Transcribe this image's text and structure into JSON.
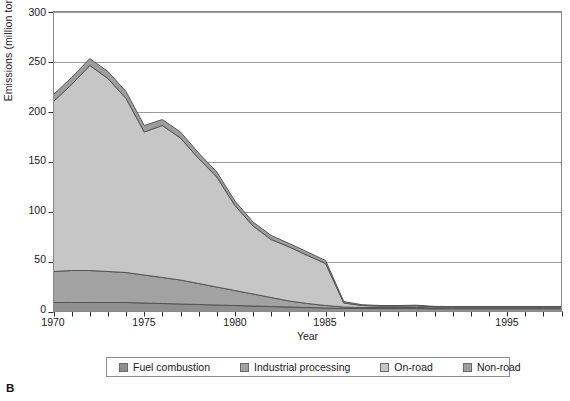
{
  "panel": {
    "label": "B"
  },
  "chart_data": {
    "type": "area",
    "stacked": true,
    "title": "",
    "xlabel": "Year",
    "ylabel": "Emissions (million tons)",
    "xlim": [
      1970,
      1998
    ],
    "ylim": [
      0,
      300
    ],
    "yticks": [
      0,
      50,
      100,
      150,
      200,
      250,
      300
    ],
    "xticks": [
      1970,
      1971,
      1972,
      1973,
      1974,
      1975,
      1976,
      1977,
      1978,
      1979,
      1980,
      1981,
      1982,
      1983,
      1984,
      1985,
      1986,
      1987,
      1988,
      1989,
      1990,
      1991,
      1992,
      1993,
      1994,
      1995,
      1996,
      1997,
      1998
    ],
    "xtick_labels": [
      1970,
      1975,
      1980,
      1985,
      1995
    ],
    "xtick_labels_shown": [
      "1970",
      "1975",
      "1980",
      "1985",
      "1995"
    ],
    "grid": "horizontal",
    "legend_position": "below",
    "x": [
      1970,
      1971,
      1972,
      1973,
      1974,
      1975,
      1976,
      1977,
      1978,
      1979,
      1980,
      1981,
      1982,
      1983,
      1984,
      1985,
      1986,
      1987,
      1988,
      1989,
      1990,
      1991,
      1992,
      1993,
      1994,
      1995,
      1996,
      1997,
      1998
    ],
    "series": [
      {
        "name": "Fuel combustion",
        "color": "#8f8f8f",
        "values": [
          9,
          9,
          9,
          9,
          9,
          8.5,
          8,
          7.5,
          7,
          6.5,
          6,
          5.5,
          5,
          4.5,
          4,
          3.5,
          3,
          3,
          3,
          3,
          3,
          2.8,
          2.8,
          2.8,
          2.8,
          2.8,
          2.8,
          2.8,
          2.8
        ]
      },
      {
        "name": "Industrial processing",
        "color": "#a2a2a2",
        "values": [
          31,
          32,
          32,
          31,
          30,
          28,
          26,
          24,
          21,
          18,
          15,
          12,
          9,
          6,
          4,
          2.5,
          1.5,
          1.0,
          0.9,
          0.9,
          1.2,
          0.6,
          0.5,
          0.5,
          0.5,
          0.5,
          0.5,
          0.5,
          0.5
        ]
      },
      {
        "name": "On-road",
        "color": "#c6c6c6",
        "values": [
          170,
          186,
          205,
          193,
          174,
          143,
          152,
          142,
          125,
          110,
          85,
          68,
          58,
          54,
          48,
          42,
          4,
          2,
          1.5,
          1.5,
          1.5,
          1.2,
          1.2,
          1.2,
          1.2,
          1.2,
          1.2,
          1.2,
          1.2
        ]
      },
      {
        "name": "Non-road",
        "color": "#9d9d9d",
        "values": [
          7,
          7,
          7,
          7,
          7,
          6.5,
          6,
          6,
          5.5,
          5,
          4.5,
          4,
          4,
          3.5,
          3.5,
          3,
          1.5,
          0.8,
          0.6,
          0.6,
          0.6,
          0.5,
          0.5,
          0.5,
          0.5,
          0.5,
          0.5,
          0.5,
          0.5
        ]
      }
    ],
    "totals": [
      217,
      234,
      253,
      240,
      220,
      186,
      192,
      179.5,
      158.5,
      139.5,
      110.5,
      89.5,
      76,
      68,
      59.5,
      51,
      10,
      6.8,
      6,
      6,
      6.3,
      5.1,
      5,
      5,
      5,
      5,
      5,
      5,
      5
    ]
  },
  "legend": {
    "items": [
      {
        "label": "Fuel combustion",
        "color": "#8f8f8f"
      },
      {
        "label": "Industrial processing",
        "color": "#a2a2a2"
      },
      {
        "label": "On-road",
        "color": "#c6c6c6"
      },
      {
        "label": "Non-road",
        "color": "#9d9d9d"
      }
    ]
  }
}
